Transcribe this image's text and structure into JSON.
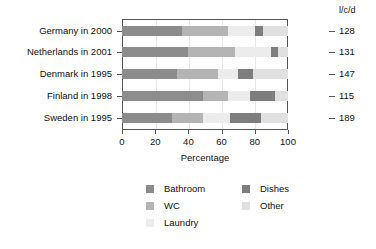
{
  "chart_data": {
    "type": "bar",
    "orientation": "horizontal",
    "stacked": true,
    "title": "",
    "xlabel": "Percentage",
    "ylabel": "",
    "xlim": [
      0,
      100
    ],
    "xticks": [
      0,
      20,
      40,
      60,
      80,
      100
    ],
    "grid": true,
    "legend_position": "bottom",
    "categories": [
      "Germany in 2000",
      "Netherlands in 2001",
      "Denmark in 1995",
      "Finland in 1998",
      "Sweden in 1995"
    ],
    "series": [
      {
        "name": "Bathroom",
        "color": "#8c8c8c",
        "values": [
          36,
          40,
          33,
          49,
          30
        ]
      },
      {
        "name": "WC",
        "color": "#b4b4b4",
        "values": [
          28,
          28,
          25,
          15,
          19
        ]
      },
      {
        "name": "Laundry",
        "color": "#ececec",
        "values": [
          16,
          22,
          12,
          13,
          16
        ]
      },
      {
        "name": "Dishes",
        "color": "#7e7e7e",
        "values": [
          5,
          4,
          9,
          15,
          19
        ]
      },
      {
        "name": "Other",
        "color": "#e0e0e0",
        "values": [
          15,
          6,
          21,
          8,
          16
        ]
      }
    ],
    "right_axis": {
      "header": "l/c/d",
      "values": [
        128,
        131,
        147,
        115,
        189
      ]
    }
  },
  "legend": {
    "column_left": [
      "Bathroom",
      "WC",
      "Laundry"
    ],
    "column_right": [
      "Dishes",
      "Other"
    ]
  }
}
